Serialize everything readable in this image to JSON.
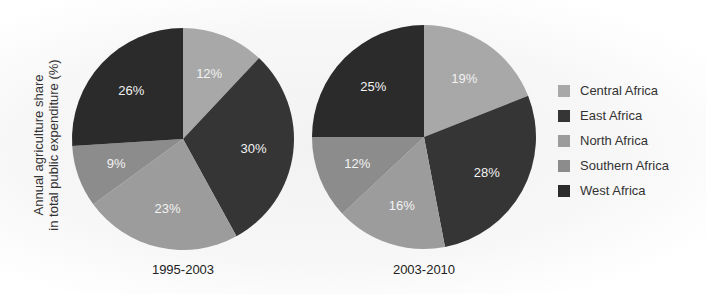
{
  "chart_data": [
    {
      "type": "pie",
      "title": "1995-2003",
      "ylabel": "Annual agriculture share in total public expenditure (%)",
      "categories": [
        "Central Africa",
        "East Africa",
        "North Africa",
        "Southern Africa",
        "West Africa"
      ],
      "values": [
        12,
        30,
        23,
        9,
        26
      ],
      "labels": [
        "12%",
        "30%",
        "23%",
        "9%",
        "26%"
      ]
    },
    {
      "type": "pie",
      "title": "2003-2010",
      "ylabel": "Annual agriculture share in total public expenditure (%)",
      "categories": [
        "Central Africa",
        "East Africa",
        "North Africa",
        "Southern Africa",
        "West Africa"
      ],
      "values": [
        19,
        28,
        16,
        12,
        25
      ],
      "labels": [
        "19%",
        "28%",
        "16%",
        "12%",
        "25%"
      ]
    }
  ],
  "ylabel_line1": "Annual agriculture share",
  "ylabel_line2": "in total public expenditure (%)",
  "pies": [
    {
      "title": "1995-2003",
      "cx": 183,
      "cy": 139,
      "r": 111,
      "values": [
        12,
        30,
        23,
        9,
        26
      ],
      "labels": [
        "12%",
        "30%",
        "23%",
        "9%",
        "26%"
      ]
    },
    {
      "title": "2003-2010",
      "cx": 424,
      "cy": 137,
      "r": 112,
      "values": [
        19,
        28,
        16,
        12,
        25
      ],
      "labels": [
        "19%",
        "28%",
        "16%",
        "12%",
        "25%"
      ]
    }
  ],
  "colors": {
    "Central Africa": "#a8a8a8",
    "East Africa": "#353535",
    "North Africa": "#9c9c9c",
    "Southern Africa": "#8c8c8c",
    "West Africa": "#2b2b2b"
  },
  "legend": [
    {
      "label": "Central Africa",
      "color": "#a8a8a8"
    },
    {
      "label": "East Africa",
      "color": "#353535"
    },
    {
      "label": "North Africa",
      "color": "#9c9c9c"
    },
    {
      "label": "Southern Africa",
      "color": "#8c8c8c"
    },
    {
      "label": "West Africa",
      "color": "#2b2b2b"
    }
  ]
}
